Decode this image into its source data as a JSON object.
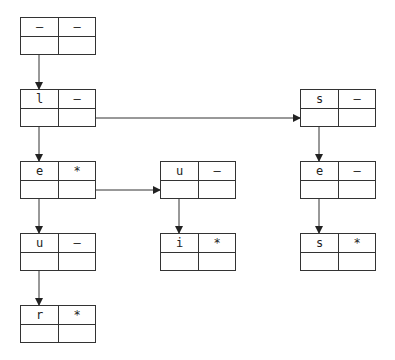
{
  "diagram": {
    "type": "trie-linked-structure",
    "nodes": [
      {
        "id": "root",
        "char": "–",
        "flag": "–",
        "x": 20,
        "y": 17
      },
      {
        "id": "l",
        "char": "l",
        "flag": "–",
        "x": 20,
        "y": 89
      },
      {
        "id": "e1",
        "char": "e",
        "flag": "*",
        "x": 20,
        "y": 161
      },
      {
        "id": "u1",
        "char": "u",
        "flag": "–",
        "x": 20,
        "y": 233
      },
      {
        "id": "r",
        "char": "r",
        "flag": "*",
        "x": 20,
        "y": 305
      },
      {
        "id": "u2",
        "char": "u",
        "flag": "–",
        "x": 160,
        "y": 161
      },
      {
        "id": "i",
        "char": "i",
        "flag": "*",
        "x": 160,
        "y": 233
      },
      {
        "id": "s1",
        "char": "s",
        "flag": "–",
        "x": 300,
        "y": 89
      },
      {
        "id": "e2",
        "char": "e",
        "flag": "–",
        "x": 300,
        "y": 161
      },
      {
        "id": "s2",
        "char": "s",
        "flag": "*",
        "x": 300,
        "y": 233
      }
    ],
    "edges": [
      {
        "from": "root",
        "to": "l",
        "kind": "child"
      },
      {
        "from": "l",
        "to": "e1",
        "kind": "child"
      },
      {
        "from": "e1",
        "to": "u1",
        "kind": "child"
      },
      {
        "from": "u1",
        "to": "r",
        "kind": "child"
      },
      {
        "from": "u2",
        "to": "i",
        "kind": "child"
      },
      {
        "from": "s1",
        "to": "e2",
        "kind": "child"
      },
      {
        "from": "e2",
        "to": "s2",
        "kind": "child"
      },
      {
        "from": "l",
        "to": "s1",
        "kind": "sibling"
      },
      {
        "from": "e1",
        "to": "u2",
        "kind": "sibling"
      }
    ],
    "colors": {
      "line": "#333333",
      "text": "#222222",
      "background": "#ffffff"
    }
  }
}
